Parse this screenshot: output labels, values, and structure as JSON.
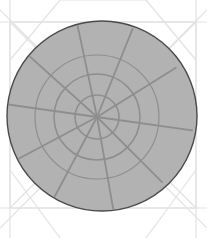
{
  "canvas": {
    "width": 207,
    "height": 238,
    "background_color": "#ffffff",
    "title": "Shaded circle with radial spoke-and-ring pattern"
  },
  "palette": {
    "circle_fill": "#b2b2b2",
    "circle_stroke": "#4a4a4a",
    "web_line": "#8e8e8e",
    "guide_line": "#e2e2e2",
    "background": "#ffffff"
  },
  "diagram": {
    "type": "radial-web-circle",
    "main_circle": {
      "name": "main-circle",
      "cx": 102,
      "cy": 116,
      "r": 95,
      "fill": "#b2b2b2",
      "stroke": "#4a4a4a",
      "stroke_width": 1.4
    },
    "hub": {
      "name": "web-hub",
      "cx": 97,
      "cy": 117
    },
    "rings": [
      {
        "name": "inner-ring",
        "r": 22,
        "stroke_width": 1.6
      },
      {
        "name": "middle-ring",
        "r": 43,
        "stroke_width": 1.6
      },
      {
        "name": "outer-ring",
        "r": 62,
        "stroke_width": 1.2
      }
    ],
    "spokes": {
      "count": 10,
      "angles_deg": [
        8,
        45,
        80,
        118,
        152,
        188,
        222,
        258,
        292,
        328
      ],
      "lengths": [
        96,
        92,
        99,
        96,
        92,
        98,
        94,
        99,
        95,
        93
      ],
      "stroke_width": 1.8
    }
  },
  "guides": {
    "frame": {
      "name": "guide-frame",
      "x": 10,
      "y": 22,
      "width": 186,
      "height": 186,
      "stroke": "#e2e2e2",
      "stroke_width": 1.2
    },
    "diagonals": [
      {
        "name": "guide-diagonal-1",
        "x1": 10,
        "y1": 22,
        "x2": 196,
        "y2": 208
      },
      {
        "name": "guide-diagonal-2",
        "x1": 196,
        "y1": 22,
        "x2": 10,
        "y2": 208
      },
      {
        "name": "guide-diagonal-3",
        "x1": 10,
        "y1": 60,
        "x2": 60,
        "y2": 0
      },
      {
        "name": "guide-diagonal-4",
        "x1": 196,
        "y1": 60,
        "x2": 146,
        "y2": 0
      },
      {
        "name": "guide-diagonal-5",
        "x1": 10,
        "y1": 170,
        "x2": 60,
        "y2": 238
      },
      {
        "name": "guide-diagonal-6",
        "x1": 196,
        "y1": 170,
        "x2": 146,
        "y2": 238
      },
      {
        "name": "guide-diagonal-7",
        "x1": 60,
        "y1": 0,
        "x2": 146,
        "y2": 0
      },
      {
        "name": "guide-diagonal-8",
        "x1": 0,
        "y1": 10,
        "x2": 46,
        "y2": 56
      },
      {
        "name": "guide-diagonal-9",
        "x1": 207,
        "y1": 10,
        "x2": 161,
        "y2": 56
      },
      {
        "name": "guide-diagonal-10",
        "x1": 0,
        "y1": 228,
        "x2": 46,
        "y2": 182
      },
      {
        "name": "guide-diagonal-11",
        "x1": 207,
        "y1": 228,
        "x2": 161,
        "y2": 182
      }
    ],
    "edges": [
      {
        "name": "guide-edge-top",
        "x1": 0,
        "y1": 22,
        "x2": 207,
        "y2": 22
      },
      {
        "name": "guide-edge-bottom",
        "x1": 0,
        "y1": 208,
        "x2": 207,
        "y2": 208
      },
      {
        "name": "guide-edge-left",
        "x1": 10,
        "y1": 0,
        "x2": 10,
        "y2": 238
      },
      {
        "name": "guide-edge-right",
        "x1": 196,
        "y1": 0,
        "x2": 196,
        "y2": 238
      }
    ]
  },
  "chart_data": {
    "type": "pie",
    "title": "",
    "subtitle": "",
    "xlabel": "",
    "ylabel": "",
    "legend_position": "none",
    "grid": false,
    "categories": [
      "sector-1",
      "sector-2",
      "sector-3",
      "sector-4",
      "sector-5",
      "sector-6",
      "sector-7",
      "sector-8",
      "sector-9",
      "sector-10"
    ],
    "values": [
      37,
      35,
      38,
      34,
      36,
      34,
      36,
      34,
      36,
      40
    ],
    "series": [
      {
        "name": "spoke-length-px",
        "values": [
          96,
          92,
          99,
          96,
          92,
          98,
          94,
          99,
          95,
          93
        ]
      },
      {
        "name": "spoke-angle-deg",
        "values": [
          8,
          45,
          80,
          118,
          152,
          188,
          222,
          258,
          292,
          328
        ]
      }
    ],
    "ring_radii_px": [
      22,
      43,
      62,
      95
    ],
    "ylim": [
      0,
      95
    ]
  }
}
